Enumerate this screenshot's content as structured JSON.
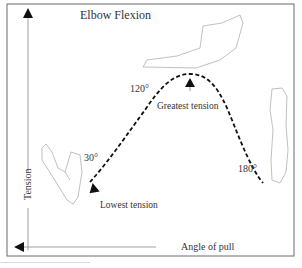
{
  "title": "Elbow Flexion",
  "axes": {
    "y_label": "Tension",
    "x_label": "Angle of pull"
  },
  "angle_labels": {
    "low": "30°",
    "mid": "120°",
    "high": "180°"
  },
  "annotations": {
    "greatest": "Greatest tension",
    "lowest": "Lowest tension"
  },
  "curve": {
    "style": "dashed",
    "points": [
      {
        "angle": 30,
        "tension": "lowest"
      },
      {
        "angle": 120,
        "tension": "rising"
      },
      {
        "angle": "peak",
        "tension": "greatest"
      },
      {
        "angle": 180,
        "tension": "falling"
      }
    ]
  },
  "illustrations": [
    "arm-at-30-degrees",
    "arm-at-90-degrees",
    "arm-at-180-degrees"
  ],
  "colors": {
    "ink": "#111111",
    "frame": "#555555",
    "sketch": "#b0b0b0",
    "text": "#333333"
  }
}
